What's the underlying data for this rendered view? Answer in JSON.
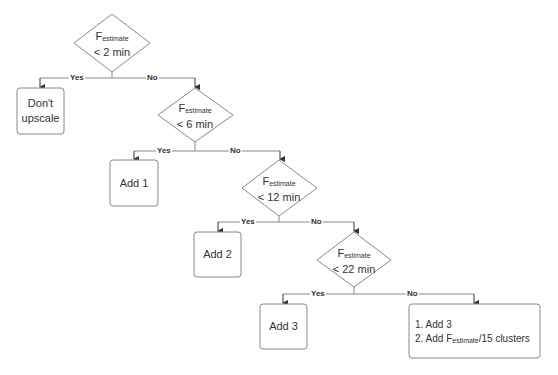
{
  "diagram": {
    "type": "decision-flowchart",
    "colors": {
      "stroke": "#888888",
      "text": "#333333",
      "background": "#ffffff"
    },
    "decisions": [
      {
        "id": "d1",
        "var": "F",
        "sub": "estimate",
        "cond": "< 2 min"
      },
      {
        "id": "d2",
        "var": "F",
        "sub": "estimate",
        "cond": "< 6 min"
      },
      {
        "id": "d3",
        "var": "F",
        "sub": "estimate",
        "cond": "< 12 min"
      },
      {
        "id": "d4",
        "var": "F",
        "sub": "estimate",
        "cond": "< 22 min"
      }
    ],
    "actions": [
      {
        "id": "a1",
        "line1": "Don't",
        "line2": "upscale"
      },
      {
        "id": "a2",
        "label": "Add 1"
      },
      {
        "id": "a3",
        "label": "Add 2"
      },
      {
        "id": "a4",
        "label": "Add 3"
      }
    ],
    "final_action": {
      "step1": "1. Add 3",
      "step2_prefix": "2. Add F",
      "step2_sub": "estimate",
      "step2_suffix": "/15 clusters"
    },
    "edges": [
      {
        "from": "d1",
        "to": "a1",
        "label": "Yes"
      },
      {
        "from": "d1",
        "to": "d2",
        "label": "No"
      },
      {
        "from": "d2",
        "to": "a2",
        "label": "Yes"
      },
      {
        "from": "d2",
        "to": "d3",
        "label": "No"
      },
      {
        "from": "d3",
        "to": "a3",
        "label": "Yes"
      },
      {
        "from": "d3",
        "to": "d4",
        "label": "No"
      },
      {
        "from": "d4",
        "to": "a4",
        "label": "Yes"
      },
      {
        "from": "d4",
        "to": "final",
        "label": "No"
      }
    ]
  }
}
